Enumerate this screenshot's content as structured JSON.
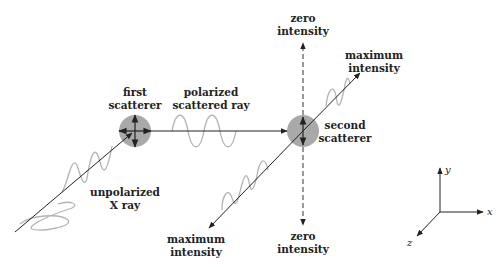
{
  "diagram": {
    "labels": {
      "first_scatterer": [
        "first",
        "scatterer"
      ],
      "polarized_ray": [
        "polarized",
        "scattered ray"
      ],
      "unpolarized": [
        "unpolarized",
        "X ray"
      ],
      "second_scatterer": [
        "second",
        "scatterer"
      ],
      "zero_top": [
        "zero",
        "intensity"
      ],
      "zero_bottom": [
        "zero",
        "intensity"
      ],
      "max_top": [
        "maximum",
        "intensity"
      ],
      "max_bottom": [
        "maximum",
        "intensity"
      ]
    },
    "axes": {
      "x": "x",
      "y": "y",
      "z": "z"
    },
    "colors": {
      "scatterer": "#a9a9a9",
      "wave": "#b4b4b4",
      "line": "#222222"
    }
  }
}
